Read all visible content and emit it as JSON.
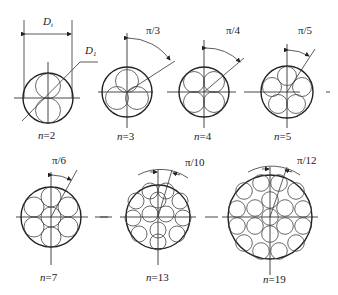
{
  "diagram": {
    "title": "",
    "dimension_labels": {
      "outer": "D",
      "outer_sub": "t",
      "inner": "D",
      "inner_sub": "1"
    },
    "figures": [
      {
        "id": "n2",
        "label_n": "n",
        "label_eq": "=2",
        "angle": ""
      },
      {
        "id": "n3",
        "label_n": "n",
        "label_eq": "=3",
        "angle": "π/3"
      },
      {
        "id": "n4",
        "label_n": "n",
        "label_eq": "=4",
        "angle": "π/4"
      },
      {
        "id": "n5",
        "label_n": "n",
        "label_eq": "=5",
        "angle": "π/5"
      },
      {
        "id": "n7",
        "label_n": "n",
        "label_eq": "=7",
        "angle": "π/6"
      },
      {
        "id": "n13",
        "label_n": "n",
        "label_eq": "=13",
        "angle": "π/10"
      },
      {
        "id": "n19",
        "label_n": "n",
        "label_eq": "=19",
        "angle": "π/12"
      }
    ]
  }
}
